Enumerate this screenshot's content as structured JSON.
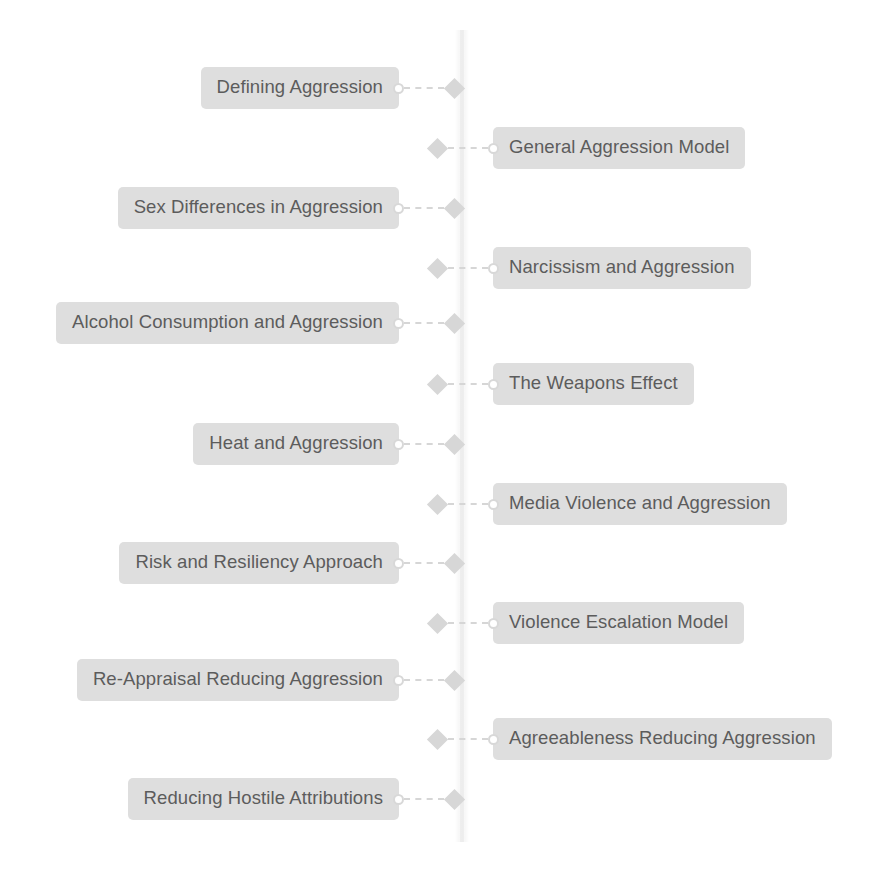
{
  "diagram": {
    "type": "vertical-timeline",
    "orientation": "alternating",
    "colors": {
      "label_background": "#dedede",
      "label_text": "#5c5c5c",
      "marker": "#d7d7d7",
      "connector": "#d6d6d6",
      "spine": "#f2f2f2",
      "page_background": "#ffffff"
    },
    "nodes": [
      {
        "label": "Defining Aggression",
        "side": "left",
        "top": 68
      },
      {
        "label": "General Aggression Model",
        "side": "right",
        "top": 128
      },
      {
        "label": "Sex Differences in Aggression",
        "side": "left",
        "top": 188
      },
      {
        "label": "Narcissism and Aggression",
        "side": "right",
        "top": 248
      },
      {
        "label": "Alcohol Consumption and Aggression",
        "side": "left",
        "top": 303
      },
      {
        "label": "The Weapons Effect",
        "side": "right",
        "top": 364
      },
      {
        "label": "Heat and Aggression",
        "side": "left",
        "top": 424
      },
      {
        "label": "Media Violence and Aggression",
        "side": "right",
        "top": 484
      },
      {
        "label": "Risk and Resiliency Approach",
        "side": "left",
        "top": 543
      },
      {
        "label": "Violence Escalation Model",
        "side": "right",
        "top": 603
      },
      {
        "label": "Re-Appraisal Reducing Aggression",
        "side": "left",
        "top": 660
      },
      {
        "label": "Agreeableness Reducing Aggression",
        "side": "right",
        "top": 719
      },
      {
        "label": "Reducing Hostile Attributions",
        "side": "left",
        "top": 779
      }
    ]
  }
}
